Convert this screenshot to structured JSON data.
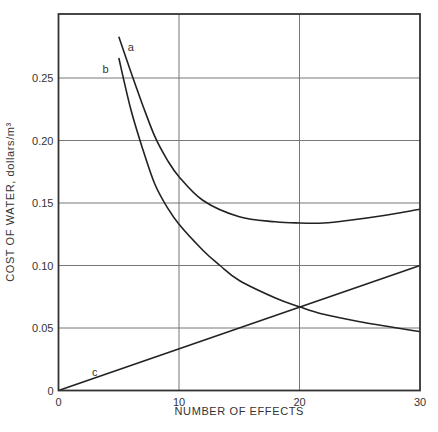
{
  "chart_data": {
    "type": "line",
    "title": "",
    "xlabel": "NUMBER OF EFFECTS",
    "ylabel": "COST OF WATER, dollars/m³",
    "xlim": [
      0,
      30
    ],
    "ylim": [
      0,
      0.3
    ],
    "xticks": [
      0,
      10,
      20,
      30
    ],
    "xtick_labels": [
      "0",
      "10",
      "20",
      "30"
    ],
    "yticks": [
      0,
      0.05,
      0.1,
      0.15,
      0.2,
      0.25
    ],
    "ytick_labels": [
      "0",
      "0.05",
      "0.10",
      "0.15",
      "0.20",
      "0.25"
    ],
    "grid": true,
    "legend": "inline labels",
    "series": [
      {
        "name": "a",
        "x": [
          5,
          6,
          7,
          8,
          9,
          10,
          12,
          15,
          18,
          20,
          22,
          24,
          27,
          30
        ],
        "values": [
          0.283,
          0.255,
          0.228,
          0.203,
          0.185,
          0.171,
          0.152,
          0.139,
          0.135,
          0.134,
          0.134,
          0.136,
          0.14,
          0.145
        ]
      },
      {
        "name": "b",
        "x": [
          5,
          6,
          7,
          8,
          9,
          10,
          12,
          13.4,
          15,
          18,
          20,
          22,
          25,
          30
        ],
        "values": [
          0.266,
          0.225,
          0.193,
          0.165,
          0.147,
          0.133,
          0.112,
          0.1,
          0.088,
          0.074,
          0.067,
          0.061,
          0.055,
          0.047
        ]
      },
      {
        "name": "c",
        "x": [
          0,
          30
        ],
        "values": [
          0,
          0.1
        ]
      }
    ],
    "annotations": [
      {
        "text": "a",
        "x": 6.0,
        "y": 0.275
      },
      {
        "text": "b",
        "x": 3.9,
        "y": 0.257
      },
      {
        "text": "c",
        "x": 3.0,
        "y": 0.015
      }
    ]
  }
}
